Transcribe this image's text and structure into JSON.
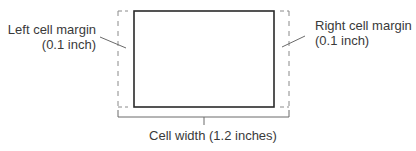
{
  "diagram": {
    "labels": {
      "left_margin_line1": "Left cell margin",
      "left_margin_line2": "(0.1 inch)",
      "right_margin_line1": "Right cell margin",
      "right_margin_line2": "(0.1 inch)",
      "cell_width": "Cell width (1.2 inches)"
    },
    "colors": {
      "cell_border": "#2a2a2a",
      "margin_dashed": "#8a8a8a",
      "bracket": "#6a6a6a",
      "text": "#3a3a3a"
    }
  }
}
